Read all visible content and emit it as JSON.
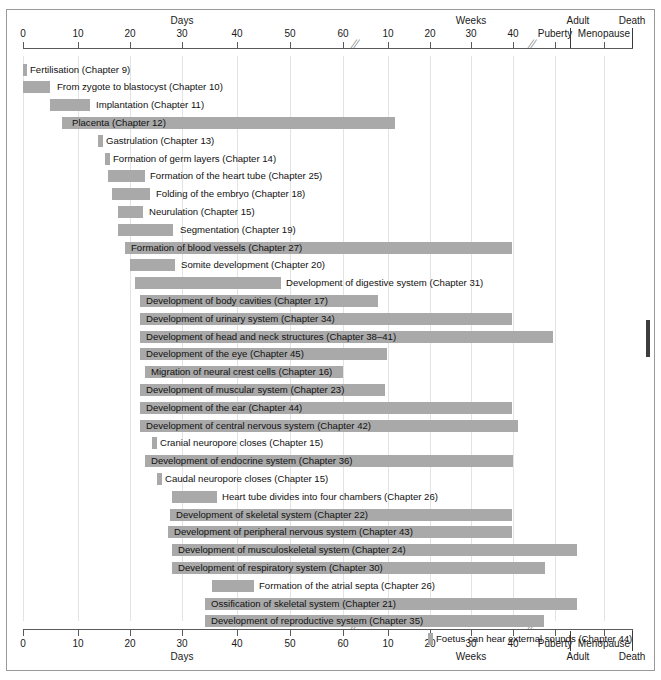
{
  "chart_data": {
    "type": "bar",
    "orientation": "horizontal-gantt",
    "xlabel": "",
    "ylabel": "",
    "grid": true,
    "legend": "none",
    "axis": {
      "top_group_labels": [
        {
          "text": "Days",
          "x": 182
        },
        {
          "text": "Weeks",
          "x": 471
        },
        {
          "text": "Adult",
          "x": 578
        },
        {
          "text": "Death",
          "x": 632
        }
      ],
      "bottom_group_labels": [
        {
          "text": "Days",
          "x": 182
        },
        {
          "text": "Weeks",
          "x": 471
        },
        {
          "text": "Adult",
          "x": 578
        },
        {
          "text": "Death",
          "x": 632
        }
      ],
      "ticks": [
        {
          "label": "0",
          "x": 23
        },
        {
          "label": "10",
          "x": 78
        },
        {
          "label": "20",
          "x": 130
        },
        {
          "label": "30",
          "x": 182
        },
        {
          "label": "40",
          "x": 237
        },
        {
          "label": "50",
          "x": 290
        },
        {
          "label": "60",
          "x": 343
        },
        {
          "label": "10",
          "x": 388
        },
        {
          "label": "20",
          "x": 430
        },
        {
          "label": "30",
          "x": 471
        },
        {
          "label": "40",
          "x": 513
        },
        {
          "label": "Puberty",
          "x": 555
        },
        {
          "label": "Menopause",
          "x": 604
        }
      ],
      "break_marks_x": [
        360,
        537
      ],
      "dividers_x": [
        570,
        632
      ],
      "units_note": "Left segment measured in days (0-60), right segment in weeks (10-40), then life stages"
    },
    "bar_color": "#a9a9a9",
    "rows": [
      {
        "label": "Fertilisation (Chapter 9)",
        "chapter": "9",
        "bar_x": 23,
        "bar_w": 4,
        "label_x": 30
      },
      {
        "label": "From zygote to blastocyst (Chapter 10)",
        "chapter": "10",
        "bar_x": 23,
        "bar_w": 27,
        "label_x": 57
      },
      {
        "label": "Implantation (Chapter 11)",
        "chapter": "11",
        "bar_x": 50,
        "bar_w": 40,
        "label_x": 96
      },
      {
        "label": "Placenta (Chapter 12)",
        "chapter": "12",
        "bar_x": 62,
        "bar_w": 333,
        "label_x": 72
      },
      {
        "label": "Gastrulation (Chapter 13)",
        "chapter": "13",
        "bar_x": 98,
        "bar_w": 5,
        "label_x": 106
      },
      {
        "label": "Formation of germ layers (Chapter 14)",
        "chapter": "14",
        "bar_x": 105,
        "bar_w": 5,
        "label_x": 113
      },
      {
        "label": "Formation of the heart tube (Chapter 25)",
        "chapter": "25",
        "bar_x": 108,
        "bar_w": 37,
        "label_x": 150
      },
      {
        "label": "Folding of the embryo (Chapter 18)",
        "chapter": "18",
        "bar_x": 112,
        "bar_w": 38,
        "label_x": 156
      },
      {
        "label": "Neurulation (Chapter 15)",
        "chapter": "15",
        "bar_x": 118,
        "bar_w": 25,
        "label_x": 149
      },
      {
        "label": "Segmentation (Chapter 19)",
        "chapter": "19",
        "bar_x": 118,
        "bar_w": 55,
        "label_x": 180
      },
      {
        "label": "Formation of blood vessels (Chapter 27)",
        "chapter": "27",
        "bar_x": 125,
        "bar_w": 387,
        "label_x": 131
      },
      {
        "label": "Somite development (Chapter 20)",
        "chapter": "20",
        "bar_x": 130,
        "bar_w": 45,
        "label_x": 181
      },
      {
        "label": "Development of digestive system (Chapter 31)",
        "chapter": "31",
        "bar_x": 135,
        "bar_w": 146,
        "label_x": 286
      },
      {
        "label": "Development of body cavities (Chapter 17)",
        "chapter": "17",
        "bar_x": 140,
        "bar_w": 238,
        "label_x": 146
      },
      {
        "label": "Development of urinary system (Chapter 34)",
        "chapter": "34",
        "bar_x": 140,
        "bar_w": 372,
        "label_x": 146
      },
      {
        "label": "Development of head and neck structures (Chapter 38–41)",
        "chapter": "38–41",
        "bar_x": 140,
        "bar_w": 413,
        "label_x": 146
      },
      {
        "label": "Development of the eye (Chapter 45)",
        "chapter": "45",
        "bar_x": 140,
        "bar_w": 247,
        "label_x": 146
      },
      {
        "label": "Migration of neural crest cells (Chapter 16)",
        "chapter": "16",
        "bar_x": 145,
        "bar_w": 198,
        "label_x": 151
      },
      {
        "label": "Development of muscular system (Chapter 23)",
        "chapter": "23",
        "bar_x": 140,
        "bar_w": 245,
        "label_x": 146
      },
      {
        "label": "Development of the ear (Chapter 44)",
        "chapter": "44",
        "bar_x": 140,
        "bar_w": 372,
        "label_x": 146
      },
      {
        "label": "Development of central nervous system (Chapter 42)",
        "chapter": "42",
        "bar_x": 140,
        "bar_w": 378,
        "label_x": 146
      },
      {
        "label": "Cranial neuropore closes (Chapter 15)",
        "chapter": "15",
        "bar_x": 152,
        "bar_w": 5,
        "label_x": 160
      },
      {
        "label": "Development of endocrine system (Chapter 36)",
        "chapter": "36",
        "bar_x": 145,
        "bar_w": 368,
        "label_x": 151
      },
      {
        "label": "Caudal neuropore closes (Chapter 15)",
        "chapter": "15",
        "bar_x": 157,
        "bar_w": 5,
        "label_x": 165
      },
      {
        "label": "Heart tube divides into four chambers (Chapter 26)",
        "chapter": "26",
        "bar_x": 172,
        "bar_w": 45,
        "label_x": 222
      },
      {
        "label": "Development of skeletal system (Chapter 22)",
        "chapter": "22",
        "bar_x": 170,
        "bar_w": 342,
        "label_x": 176
      },
      {
        "label": "Development of peripheral nervous system (Chapter 43)",
        "chapter": "43",
        "bar_x": 168,
        "bar_w": 344,
        "label_x": 174
      },
      {
        "label": "Development of musculoskeletal system (Chapter 24)",
        "chapter": "24",
        "bar_x": 172,
        "bar_w": 405,
        "label_x": 178
      },
      {
        "label": "Development of respiratory system (Chapter 30)",
        "chapter": "30",
        "bar_x": 172,
        "bar_w": 373,
        "label_x": 178
      },
      {
        "label": "Formation of the atrial septa (Chapter 26)",
        "chapter": "26",
        "bar_x": 212,
        "bar_w": 42,
        "label_x": 259
      },
      {
        "label": "Ossification of skeletal system (Chapter 21)",
        "chapter": "21",
        "bar_x": 205,
        "bar_w": 372,
        "label_x": 211
      },
      {
        "label": "Development of reproductive system (Chapter 35)",
        "chapter": "35",
        "bar_x": 205,
        "bar_w": 339,
        "label_x": 211
      },
      {
        "label": "Foetus can hear external sounds (Chapter 44)",
        "chapter": "44",
        "bar_x": 428,
        "bar_w": 5,
        "label_x": 436
      }
    ]
  }
}
